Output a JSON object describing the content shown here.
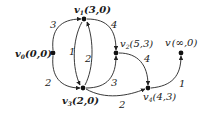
{
  "nodes": [
    {
      "id": "v0",
      "name": "v",
      "sub": "0",
      "label": "(0,0)",
      "x": 53,
      "y": 53
    },
    {
      "id": "v1",
      "name": "v",
      "sub": "1",
      "label": "(3,0)",
      "x": 84,
      "y": 19
    },
    {
      "id": "v2",
      "name": "v",
      "sub": "2",
      "label": "(5,3)",
      "x": 116,
      "y": 53
    },
    {
      "id": "v3",
      "name": "v",
      "sub": "3",
      "label": "(2,0)",
      "x": 83,
      "y": 88
    },
    {
      "id": "v4",
      "name": "v",
      "sub": "4",
      "label": "(4,3)",
      "x": 148,
      "y": 88
    },
    {
      "id": "v",
      "name": "v",
      "sub": "",
      "label": "(∞,0)",
      "x": 181,
      "y": 53
    }
  ],
  "edges": [
    {
      "from": "v0",
      "to": "v1",
      "weight": "3"
    },
    {
      "from": "v0",
      "to": "v3",
      "weight": "2"
    },
    {
      "from": "v1",
      "to": "v3",
      "weight": "1"
    },
    {
      "from": "v3",
      "to": "v1",
      "weight": "2"
    },
    {
      "from": "v1",
      "to": "v2",
      "weight": "4"
    },
    {
      "from": "v3",
      "to": "v2",
      "weight": "3"
    },
    {
      "from": "v2",
      "to": "v4",
      "weight": "4"
    },
    {
      "from": "v3",
      "to": "v4",
      "weight": "2"
    },
    {
      "from": "v4",
      "to": "v",
      "weight": "1"
    }
  ]
}
